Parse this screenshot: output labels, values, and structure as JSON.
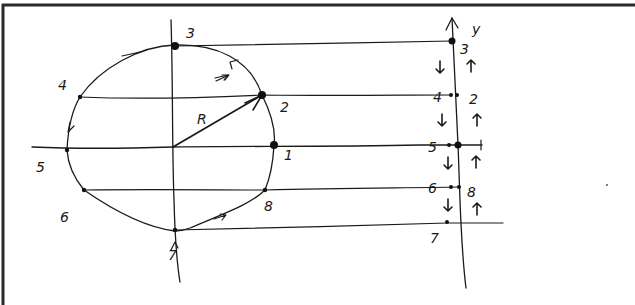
{
  "diagram": {
    "frame": {
      "border_color": "#2a2a2a",
      "background": "#ffffff"
    },
    "radius_label": "R",
    "axis_label": "y",
    "circle": {
      "cx": 173,
      "cy": 147,
      "rx": 102,
      "ry": 103
    },
    "circle_points": [
      {
        "id": "1",
        "label": "1",
        "x": 274,
        "y": 145,
        "lx": 284,
        "ly": 160,
        "big": true
      },
      {
        "id": "2",
        "label": "2",
        "x": 262,
        "y": 95,
        "lx": 280,
        "ly": 112,
        "big": true
      },
      {
        "id": "3",
        "label": "3",
        "x": 175,
        "y": 46,
        "lx": 186,
        "ly": 36,
        "big": true
      },
      {
        "id": "4",
        "label": "4",
        "x": 80,
        "y": 97,
        "lx": 60,
        "ly": 90,
        "big": false
      },
      {
        "id": "5",
        "label": "5",
        "x": 67,
        "y": 150,
        "lx": 37,
        "ly": 172,
        "big": false
      },
      {
        "id": "6",
        "label": "6",
        "x": 84,
        "y": 190,
        "lx": 60,
        "ly": 222,
        "big": false
      },
      {
        "id": "7",
        "label": "7",
        "x": 175,
        "y": 230,
        "lx": 168,
        "ly": 258,
        "big": false
      },
      {
        "id": "8",
        "label": "8",
        "x": 265,
        "y": 190,
        "lx": 265,
        "ly": 210,
        "big": false
      }
    ],
    "axis_points": [
      {
        "id": "3",
        "label": "3",
        "x": 452,
        "y": 41,
        "lx": 460,
        "ly": 54,
        "side": "right"
      },
      {
        "id": "4",
        "label": "4",
        "x": 451,
        "y": 95,
        "lx": 433,
        "ly": 102,
        "side": "left"
      },
      {
        "id": "2",
        "label": "2",
        "x": 457,
        "y": 95,
        "lx": 470,
        "ly": 103,
        "side": "right"
      },
      {
        "id": "5",
        "label": "5",
        "x": 449,
        "y": 145,
        "lx": 427,
        "ly": 152,
        "side": "left"
      },
      {
        "id": "1",
        "label": "1",
        "x": 458,
        "y": 145,
        "lx": 478,
        "ly": 150,
        "side": "right"
      },
      {
        "id": "6",
        "label": "6",
        "x": 451,
        "y": 187,
        "lx": 428,
        "ly": 192,
        "side": "left"
      },
      {
        "id": "8",
        "label": "8",
        "x": 459,
        "y": 187,
        "lx": 467,
        "ly": 196,
        "side": "right"
      },
      {
        "id": "7",
        "label": "7",
        "x": 447,
        "y": 222,
        "lx": 430,
        "ly": 242,
        "side": "left"
      }
    ],
    "motion_arrows": {
      "left_column_down": [
        {
          "x": 440,
          "y": 67
        },
        {
          "x": 442,
          "y": 120
        },
        {
          "x": 448,
          "y": 163
        },
        {
          "x": 448,
          "y": 205
        }
      ],
      "right_column_up": [
        {
          "x": 471,
          "y": 66
        },
        {
          "x": 477,
          "y": 120
        },
        {
          "x": 476,
          "y": 162
        },
        {
          "x": 477,
          "y": 209
        }
      ]
    }
  }
}
